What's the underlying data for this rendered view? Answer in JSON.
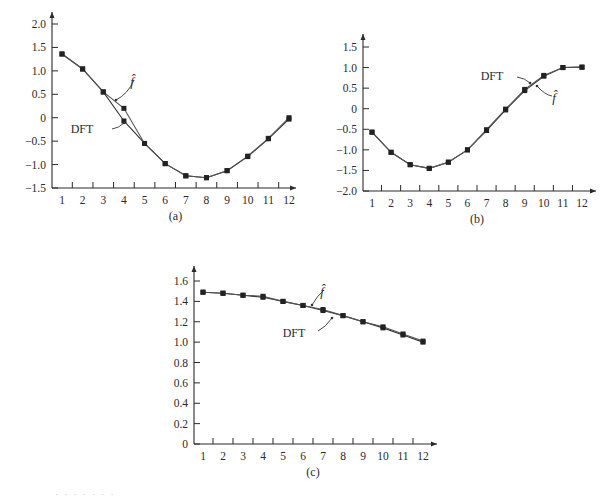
{
  "chart_data": [
    {
      "id": "a",
      "type": "line",
      "caption": "(a)",
      "title": "",
      "xlabel": "",
      "ylabel": "",
      "x": [
        1,
        2,
        3,
        4,
        5,
        6,
        7,
        8,
        9,
        10,
        11,
        12
      ],
      "xticks": [
        "1",
        "2",
        "3",
        "4",
        "5",
        "6",
        "7",
        "8",
        "9",
        "10",
        "11",
        "12"
      ],
      "yticks": [
        "-1.5",
        "-1.0",
        "-0.5",
        "0",
        "0.5",
        "1.0",
        "1.5",
        "2.0"
      ],
      "ytick_values": [
        -1.5,
        -1.0,
        -0.5,
        0,
        0.5,
        1.0,
        1.5,
        2.0
      ],
      "ylim": [
        -1.5,
        2.0
      ],
      "grid": false,
      "series": [
        {
          "name": "DFT",
          "values": [
            1.36,
            1.04,
            0.55,
            -0.07,
            -0.55,
            -0.98,
            -1.24,
            -1.28,
            -1.13,
            -0.83,
            -0.45,
            -0.03
          ]
        },
        {
          "name": "f̂",
          "values": [
            1.36,
            1.04,
            0.55,
            0.2,
            -0.55,
            -0.98,
            -1.24,
            -1.28,
            -1.13,
            -0.82,
            -0.44,
            0.0
          ]
        }
      ],
      "annotations": [
        {
          "text": "f̂",
          "target_series": "f̂"
        },
        {
          "text": "DFT",
          "target_series": "DFT"
        }
      ],
      "frame": {
        "x0": 52,
        "x1": 296,
        "y_top": 12,
        "y_bottom": 188,
        "px_x1": 62,
        "px_x12": 289,
        "px_ymin": 188,
        "px_ymax": 24
      },
      "label_pos": {
        "fhat": [
          132,
          86
        ],
        "fhat_arrow": [
          [
            134,
            80
          ],
          [
            128,
            94
          ],
          [
            116,
            100
          ]
        ],
        "dft": [
          82,
          133
        ],
        "dft_arrow": [
          [
            112,
            129
          ],
          [
            119,
            128
          ],
          [
            124,
            123
          ]
        ]
      }
    },
    {
      "id": "b",
      "type": "line",
      "caption": "(b)",
      "title": "",
      "xlabel": "",
      "ylabel": "",
      "x": [
        1,
        2,
        3,
        4,
        5,
        6,
        7,
        8,
        9,
        10,
        11,
        12
      ],
      "xticks": [
        "1",
        "2",
        "3",
        "4",
        "5",
        "6",
        "7",
        "8",
        "9",
        "10",
        "11",
        "12"
      ],
      "yticks": [
        "-2.0",
        "-1.5",
        "-1.0",
        "-0.5",
        "0",
        "0.5",
        "1.0",
        "1.5"
      ],
      "ytick_values": [
        -2.0,
        -1.5,
        -1.0,
        -0.5,
        0,
        0.5,
        1.0,
        1.5
      ],
      "ylim": [
        -2.0,
        1.5
      ],
      "grid": false,
      "series": [
        {
          "name": "DFT",
          "values": [
            -0.57,
            -1.06,
            -1.36,
            -1.45,
            -1.3,
            -1.0,
            -0.53,
            -0.03,
            0.44,
            0.79,
            1.0,
            1.01
          ]
        },
        {
          "name": "f̂",
          "values": [
            -0.57,
            -1.06,
            -1.36,
            -1.45,
            -1.3,
            -1.0,
            -0.51,
            -0.01,
            0.47,
            0.81,
            1.0,
            1.01
          ]
        }
      ],
      "annotations": [
        {
          "text": "DFT",
          "target_series": "DFT"
        },
        {
          "text": "f̂",
          "target_series": "f̂"
        }
      ],
      "frame": {
        "x0": 363,
        "x1": 596,
        "y_top": 34,
        "y_bottom": 191,
        "px_x1": 372,
        "px_x12": 582,
        "px_ymin": 191,
        "px_ymax": 47
      },
      "label_pos": {
        "dft": [
          492,
          80
        ],
        "dft_arrow": [
          [
            517,
            77
          ],
          [
            525,
            78
          ],
          [
            530,
            83
          ]
        ],
        "fhat": [
          554,
          102
        ],
        "fhat_arrow": [
          [
            552,
            96
          ],
          [
            545,
            95
          ],
          [
            537,
            86
          ]
        ]
      }
    },
    {
      "id": "c",
      "type": "line",
      "caption": "(c)",
      "title": "",
      "xlabel": "",
      "ylabel": "",
      "x": [
        1,
        2,
        3,
        4,
        5,
        6,
        7,
        8,
        9,
        10,
        11,
        12
      ],
      "xticks": [
        "1",
        "2",
        "3",
        "4",
        "5",
        "6",
        "7",
        "8",
        "9",
        "10",
        "11",
        "12"
      ],
      "yticks": [
        "0",
        "0.2",
        "0.4",
        "0.6",
        "0.8",
        "1.0",
        "1.2",
        "1.4",
        "1.6"
      ],
      "ytick_values": [
        0,
        0.2,
        0.4,
        0.6,
        0.8,
        1.0,
        1.2,
        1.4,
        1.6
      ],
      "ylim": [
        0,
        1.6
      ],
      "grid": false,
      "series": [
        {
          "name": "DFT",
          "values": [
            1.49,
            1.48,
            1.46,
            1.44,
            1.4,
            1.36,
            1.31,
            1.26,
            1.2,
            1.14,
            1.07,
            1.0
          ]
        },
        {
          "name": "f̂",
          "values": [
            1.49,
            1.48,
            1.46,
            1.45,
            1.4,
            1.36,
            1.32,
            1.26,
            1.2,
            1.15,
            1.08,
            1.01
          ]
        }
      ],
      "annotations": [
        {
          "text": "f̂",
          "target_series": "f̂"
        },
        {
          "text": "DFT",
          "target_series": "DFT"
        }
      ],
      "frame": {
        "x0": 194,
        "x1": 437,
        "y_top": 266,
        "y_bottom": 444,
        "px_x1": 203,
        "px_x12": 423,
        "px_ymin": 444,
        "px_ymax": 281
      },
      "label_pos": {
        "fhat": [
          322,
          296
        ],
        "fhat_arrow": [
          [
            324,
            290
          ],
          [
            317,
            296
          ],
          [
            312,
            305
          ]
        ],
        "dft": [
          294,
          337
        ],
        "dft_arrow": [
          [
            318,
            331
          ],
          [
            326,
            327
          ],
          [
            332,
            318
          ]
        ]
      }
    }
  ],
  "footnote": "· ·  · ·    · ·  ·"
}
